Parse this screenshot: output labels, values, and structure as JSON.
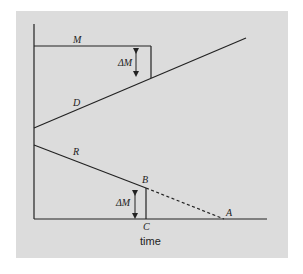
{
  "diagram": {
    "labels": {
      "M": "M",
      "D": "D",
      "R": "R",
      "B": "B",
      "A": "A",
      "C": "C",
      "delta_top": "ΔM",
      "delta_bottom": "ΔM"
    },
    "x_axis_label": "time",
    "colors": {
      "background": "#dcdcdc",
      "line": "#222222"
    }
  }
}
